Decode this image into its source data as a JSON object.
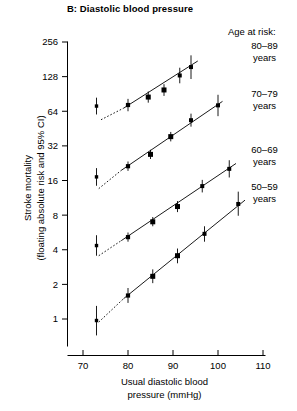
{
  "chart_data": {
    "type": "scatter",
    "title": "B: Diastolic blood pressure",
    "xlabel": "Usual diastolic blood pressure (mmHg)",
    "xlabel_line1": "Usual diastolic blood",
    "xlabel_line2": "pressure (mmHg)",
    "ylabel": "Stroke mortality (floating absolute risk and 95% CI)",
    "ylabel_line1": "Stroke mortality",
    "ylabel_line2": "(floating absolute risk and 95% CI)",
    "yscale": "log2",
    "xlim": [
      66,
      112
    ],
    "ylim": [
      0.72,
      300
    ],
    "xticks": [
      70,
      80,
      90,
      100,
      110
    ],
    "yticks": [
      1,
      2,
      4,
      8,
      16,
      32,
      64,
      128,
      256
    ],
    "grid": false,
    "legend_position": "right",
    "legend_heading": "Age at risk:",
    "series": [
      {
        "name": "80–89 years",
        "legend_line1": "80–89",
        "legend_line2": "years",
        "points": [
          {
            "x": 73.0,
            "y": 71.0,
            "ci_low": 60.0,
            "ci_high": 84.0
          },
          {
            "x": 80.0,
            "y": 72.5,
            "ci_low": 64.0,
            "ci_high": 82.0
          },
          {
            "x": 84.5,
            "y": 85.0,
            "ci_low": 76.0,
            "ci_high": 95.0
          },
          {
            "x": 88.0,
            "y": 98.0,
            "ci_low": 87.0,
            "ci_high": 110.0
          },
          {
            "x": 91.5,
            "y": 131.0,
            "ci_low": 112.0,
            "ci_high": 153.0
          },
          {
            "x": 94.0,
            "y": 155.0,
            "ci_low": 122.0,
            "ci_high": 196.0
          }
        ],
        "fit_solid": {
          "x0": 79.0,
          "y0": 68.0,
          "x1": 95.5,
          "y1": 175.0
        },
        "fit_dashed": {
          "x0": 74.0,
          "y0": 54.0,
          "x1": 79.0,
          "y1": 68.0
        }
      },
      {
        "name": "70–79 years",
        "legend_line1": "70–79",
        "legend_line2": "years",
        "points": [
          {
            "x": 73.0,
            "y": 17.2,
            "ci_low": 14.4,
            "ci_high": 20.5
          },
          {
            "x": 80.0,
            "y": 21.3,
            "ci_low": 19.4,
            "ci_high": 23.4
          },
          {
            "x": 85.0,
            "y": 27.0,
            "ci_low": 24.6,
            "ci_high": 29.6
          },
          {
            "x": 89.5,
            "y": 38.5,
            "ci_low": 35.0,
            "ci_high": 42.3
          },
          {
            "x": 94.0,
            "y": 53.5,
            "ci_low": 47.0,
            "ci_high": 61.0
          },
          {
            "x": 100.0,
            "y": 72.0,
            "ci_low": 58.0,
            "ci_high": 89.0
          }
        ],
        "fit_solid": {
          "x0": 78.5,
          "y0": 19.6,
          "x1": 101.0,
          "y1": 78.0
        },
        "fit_dashed": {
          "x0": 73.5,
          "y0": 13.6,
          "x1": 78.5,
          "y1": 19.6
        }
      },
      {
        "name": "60–69 years",
        "legend_line1": "60–69",
        "legend_line2": "years",
        "points": [
          {
            "x": 73.0,
            "y": 4.35,
            "ci_low": 3.55,
            "ci_high": 5.35
          },
          {
            "x": 80.0,
            "y": 5.15,
            "ci_low": 4.7,
            "ci_high": 5.65
          },
          {
            "x": 85.5,
            "y": 7.0,
            "ci_low": 6.4,
            "ci_high": 7.7
          },
          {
            "x": 91.0,
            "y": 9.5,
            "ci_low": 8.5,
            "ci_high": 10.6
          },
          {
            "x": 96.5,
            "y": 14.3,
            "ci_low": 12.6,
            "ci_high": 16.2
          },
          {
            "x": 102.5,
            "y": 20.2,
            "ci_low": 17.0,
            "ci_high": 24.0
          }
        ],
        "fit_solid": {
          "x0": 78.5,
          "y0": 4.8,
          "x1": 104.0,
          "y1": 22.5
        },
        "fit_dashed": {
          "x0": 73.5,
          "y0": 3.55,
          "x1": 78.5,
          "y1": 4.8
        }
      },
      {
        "name": "50–59 years",
        "legend_line1": "50–59",
        "legend_line2": "years",
        "points": [
          {
            "x": 73.0,
            "y": 0.97,
            "ci_low": 0.72,
            "ci_high": 1.3
          },
          {
            "x": 80.0,
            "y": 1.6,
            "ci_low": 1.38,
            "ci_high": 1.86
          },
          {
            "x": 85.5,
            "y": 2.35,
            "ci_low": 2.05,
            "ci_high": 2.7
          },
          {
            "x": 91.0,
            "y": 3.55,
            "ci_low": 3.05,
            "ci_high": 4.1
          },
          {
            "x": 97.0,
            "y": 5.5,
            "ci_low": 4.7,
            "ci_high": 6.4
          },
          {
            "x": 104.5,
            "y": 10.0,
            "ci_low": 7.9,
            "ci_high": 12.8
          }
        ],
        "fit_solid": {
          "x0": 79.0,
          "y0": 1.5,
          "x1": 106.0,
          "y1": 10.8
        },
        "fit_dashed": {
          "x0": 73.5,
          "y0": 0.94,
          "x1": 79.0,
          "y1": 1.5
        }
      }
    ]
  }
}
